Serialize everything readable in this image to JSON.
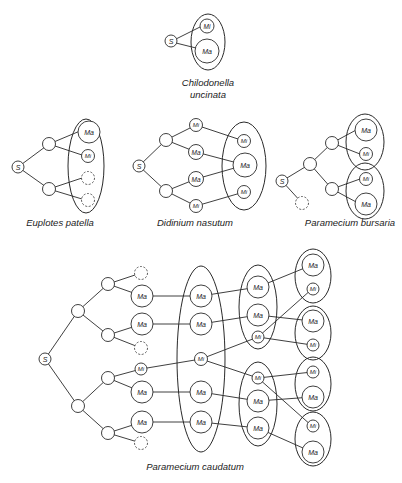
{
  "figure": {
    "node_labels": {
      "start": "S",
      "macronucleus": "Ma",
      "micronucleus": "Mi"
    },
    "species": [
      {
        "id": "chilodonella",
        "caption_line1": "Chilodonella",
        "caption_line2": "uncinata"
      },
      {
        "id": "euplotes",
        "caption": "Euplotes patella"
      },
      {
        "id": "didinium",
        "caption": "Didinium nasutum"
      },
      {
        "id": "bursaria",
        "caption": "Paramecium bursaria"
      },
      {
        "id": "caudatum",
        "caption": "Paramecium caudatum"
      }
    ],
    "colors": {
      "line": "#2a2a2a",
      "background": "#ffffff"
    }
  }
}
